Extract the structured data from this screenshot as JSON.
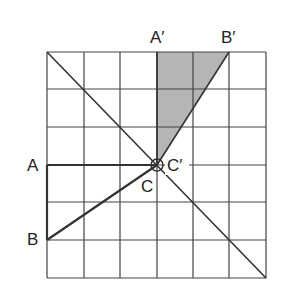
{
  "diagram": {
    "type": "rotation-on-grid",
    "grid": {
      "columns": 6,
      "rows": 6,
      "x0": 47,
      "y0": 52,
      "x1": 266,
      "y1": 278
    },
    "labels": {
      "A": "A",
      "B": "B",
      "C": "C",
      "A_prime": "A′",
      "B_prime": "B′",
      "C_prime": "C′"
    },
    "original_triangle": {
      "vertices": [
        "A",
        "B",
        "C"
      ],
      "grid_points": [
        [
          0,
          3
        ],
        [
          0,
          5
        ],
        [
          3,
          3
        ]
      ]
    },
    "rotated_triangle": {
      "vertices": [
        "A′",
        "B′",
        "C′"
      ],
      "grid_points": [
        [
          3,
          0
        ],
        [
          5,
          0
        ],
        [
          3,
          3
        ]
      ],
      "fill": "#b3b3b3"
    },
    "center_of_rotation": "C",
    "colors": {
      "line": "#333333",
      "grid": "#444444",
      "shade": "#b3b3b3",
      "background": "#ffffff"
    }
  }
}
